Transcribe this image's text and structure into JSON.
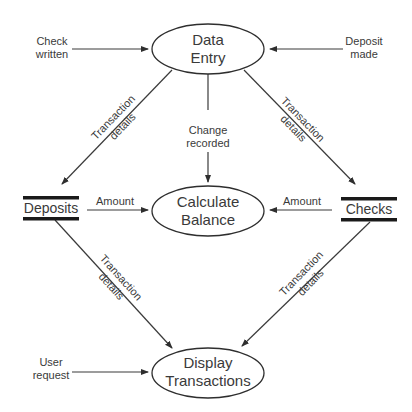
{
  "diagram": {
    "type": "data-flow-diagram",
    "processes": {
      "data_entry": {
        "line1": "Data",
        "line2": "Entry"
      },
      "calculate_balance": {
        "line1": "Calculate",
        "line2": "Balance"
      },
      "display_transactions": {
        "line1": "Display",
        "line2": "Transactions"
      }
    },
    "stores": {
      "deposits": "Deposits",
      "checks": "Checks"
    },
    "external_inputs": {
      "check_written": {
        "line1": "Check",
        "line2": "written"
      },
      "deposit_made": {
        "line1": "Deposit",
        "line2": "made"
      },
      "user_request": {
        "line1": "User",
        "line2": "request"
      }
    },
    "flows": {
      "entry_to_deposits": {
        "line1": "Transaction",
        "line2": "details"
      },
      "entry_to_checks": {
        "line1": "Transaction",
        "line2": "details"
      },
      "entry_to_balance": {
        "line1": "Change",
        "line2": "recorded"
      },
      "deposits_to_balance": "Amount",
      "checks_to_balance": "Amount",
      "deposits_to_display": {
        "line1": "Transaction",
        "line2": "details"
      },
      "checks_to_display": {
        "line1": "Transaction",
        "line2": "details"
      }
    },
    "colors": {
      "line": "#3a3a3a",
      "bar": "#1a1a1a",
      "background": "#ffffff"
    }
  }
}
